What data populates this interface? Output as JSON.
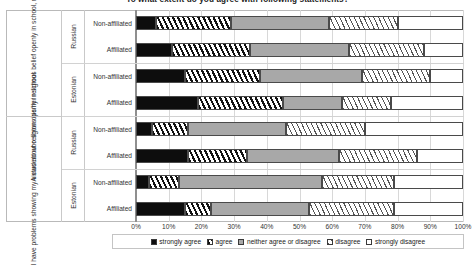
{
  "chart_data": {
    "type": "bar",
    "orientation": "horizontal",
    "stacked": true,
    "stacked_100pct": true,
    "title": "To what extent do you agree with following statements?",
    "xlabel": "",
    "ylabel": "",
    "xlim": [
      0,
      100
    ],
    "xticks": [
      "0%",
      "10%",
      "20%",
      "30%",
      "40%",
      "50%",
      "60%",
      "70%",
      "80%",
      "90%",
      "100%"
    ],
    "grid": true,
    "legend_position": "bottom",
    "legend": [
      "strongly agree",
      "agree",
      "neither agree or disagree",
      "disagree",
      "strongly disagree"
    ],
    "series": [
      {
        "name": "strongly agree",
        "fill": "black",
        "values": [
          6,
          11,
          15,
          19,
          5,
          16,
          4,
          15
        ]
      },
      {
        "name": "agree",
        "fill": "dark-hatch",
        "values": [
          23,
          24,
          23,
          26,
          11,
          18,
          9,
          8
        ]
      },
      {
        "name": "neither agree or disagree",
        "fill": "gray",
        "values": [
          30,
          30,
          31,
          18,
          30,
          28,
          44,
          30
        ]
      },
      {
        "name": "disagree",
        "fill": "light-hatch",
        "values": [
          21,
          23,
          21,
          15,
          24,
          24,
          22,
          26
        ]
      },
      {
        "name": "strongly disagree",
        "fill": "white",
        "values": [
          20,
          12,
          10,
          22,
          30,
          14,
          21,
          21
        ]
      }
    ],
    "groups": [
      {
        "statement": "A student who shows his/her religious belief openly in school, risks being mocked",
        "nationalities": [
          {
            "name": "Russian",
            "rows": [
              "Non-affiliated",
              "Affiliated"
            ]
          },
          {
            "name": "Estonian",
            "rows": [
              "Non-affiliated",
              "Affiliated"
            ]
          }
        ]
      },
      {
        "statement": "I have problems showing my views about religion openly in school",
        "nationalities": [
          {
            "name": "Russian",
            "rows": [
              "Non-affiliated",
              "Affiliated"
            ]
          },
          {
            "name": "Estonian",
            "rows": [
              "Non-affiliated",
              "Affiliated"
            ]
          }
        ]
      }
    ],
    "categories": [
      "Russian Non-affiliated",
      "Russian Affiliated",
      "Estonian Non-affiliated",
      "Estonian Affiliated",
      "Russian Non-affiliated",
      "Russian Affiliated",
      "Estonian Non-affiliated",
      "Estonian Affiliated"
    ]
  }
}
